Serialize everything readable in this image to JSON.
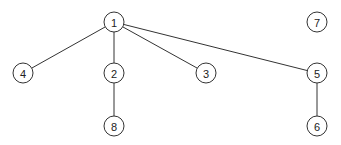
{
  "diagram": {
    "type": "graph",
    "node_radius": 10,
    "nodes": [
      {
        "id": "1",
        "label": "1",
        "x": 114,
        "y": 22
      },
      {
        "id": "2",
        "label": "2",
        "x": 114,
        "y": 73
      },
      {
        "id": "3",
        "label": "3",
        "x": 206,
        "y": 73
      },
      {
        "id": "4",
        "label": "4",
        "x": 23,
        "y": 73
      },
      {
        "id": "5",
        "label": "5",
        "x": 317,
        "y": 73
      },
      {
        "id": "6",
        "label": "6",
        "x": 317,
        "y": 126
      },
      {
        "id": "7",
        "label": "7",
        "x": 317,
        "y": 22
      },
      {
        "id": "8",
        "label": "8",
        "x": 114,
        "y": 126
      }
    ],
    "edges": [
      {
        "from": "1",
        "to": "4"
      },
      {
        "from": "1",
        "to": "2"
      },
      {
        "from": "1",
        "to": "3"
      },
      {
        "from": "1",
        "to": "5"
      },
      {
        "from": "2",
        "to": "8"
      },
      {
        "from": "5",
        "to": "6"
      }
    ]
  }
}
